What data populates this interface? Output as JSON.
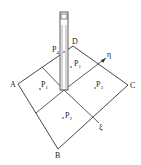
{
  "diagram": {
    "vertices": {
      "A": "A",
      "B": "B",
      "C": "C",
      "D": "D",
      "E": "E"
    },
    "axes": {
      "eta": "η",
      "xi": "ξ"
    },
    "points": [
      {
        "label": "P",
        "sub": "4"
      },
      {
        "label": "P",
        "sub": "1"
      },
      {
        "label": "P",
        "sub": "1"
      },
      {
        "label": "P",
        "sub": "3"
      },
      {
        "label": "P",
        "sub": "2"
      }
    ],
    "colors": {
      "line": "#333333",
      "background": "#ffffff"
    }
  }
}
